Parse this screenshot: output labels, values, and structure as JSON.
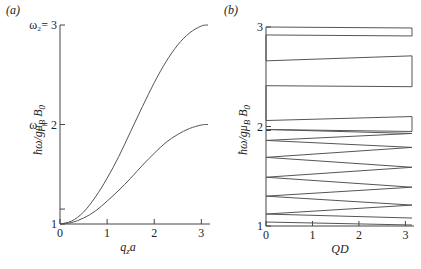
{
  "chart_data": [
    {
      "panel_label": "(a)",
      "type": "line",
      "title": "",
      "xlabel": "q_z a",
      "xlabel_main": "q",
      "xlabel_sub": "z",
      "xlabel_tail": "a",
      "ylabel": "ħω/gμ_B B_0",
      "xlim": [
        0,
        3.1416
      ],
      "ylim": [
        1,
        3
      ],
      "xticks": [
        0,
        1,
        2,
        3
      ],
      "xtick_labels": [
        "0",
        "1",
        "2",
        "3"
      ],
      "yticks": [
        1,
        2,
        3
      ],
      "ytick_labels": [
        "1",
        "ω₁= 2",
        "ω₂= 3"
      ],
      "minor_yticks": [
        1.15
      ],
      "grid": false,
      "series": [
        {
          "name": "upper branch (to ω₂)",
          "x": [
            0,
            0.25,
            0.5,
            0.75,
            1.0,
            1.25,
            1.5,
            1.75,
            2.0,
            2.25,
            2.5,
            2.75,
            3.0,
            3.1416
          ],
          "y": [
            1.0,
            1.03,
            1.12,
            1.27,
            1.46,
            1.68,
            1.93,
            2.18,
            2.42,
            2.63,
            2.8,
            2.92,
            2.99,
            3.0
          ]
        },
        {
          "name": "lower branch (to ω₁)",
          "x": [
            0,
            0.25,
            0.5,
            0.75,
            1.0,
            1.25,
            1.5,
            1.75,
            2.0,
            2.25,
            2.5,
            2.75,
            3.0,
            3.1416
          ],
          "y": [
            1.0,
            1.015,
            1.06,
            1.13,
            1.23,
            1.34,
            1.46,
            1.59,
            1.71,
            1.82,
            1.9,
            1.96,
            1.995,
            2.0
          ]
        }
      ]
    },
    {
      "panel_label": "(b)",
      "type": "line",
      "title": "",
      "xlabel": "QD",
      "ylabel": "ħω/gμ_B B_0",
      "xlim": [
        0,
        3.1416
      ],
      "ylim": [
        1,
        3
      ],
      "xticks": [
        0,
        1,
        2,
        3
      ],
      "xtick_labels": [
        "0",
        "1",
        "2",
        "3"
      ],
      "yticks": [
        1,
        2,
        3
      ],
      "ytick_labels": [
        "1",
        "2",
        "3"
      ],
      "minor_yticks": [
        1.96
      ],
      "grid": false,
      "series": [
        {
          "name": "band polyline (zigzag between QD=0 and QD=π)",
          "x": [
            0,
            3.1416,
            3.1416,
            0,
            0,
            3.1416,
            3.1416,
            0,
            0,
            3.1416,
            3.1416,
            0,
            3.1416,
            0,
            3.1416,
            0,
            3.1416,
            0,
            3.1416,
            0,
            3.1416,
            0,
            3.1416
          ],
          "y": [
            3.0,
            2.99,
            2.91,
            2.92,
            2.66,
            2.71,
            2.4,
            2.41,
            2.06,
            2.1,
            1.95,
            1.97,
            1.93,
            1.86,
            1.79,
            1.69,
            1.59,
            1.49,
            1.39,
            1.3,
            1.21,
            1.12,
            1.08
          ]
        },
        {
          "name": "bottom band line",
          "x": [
            0,
            3.1416
          ],
          "y": [
            1.04,
            1.01
          ]
        }
      ]
    }
  ]
}
